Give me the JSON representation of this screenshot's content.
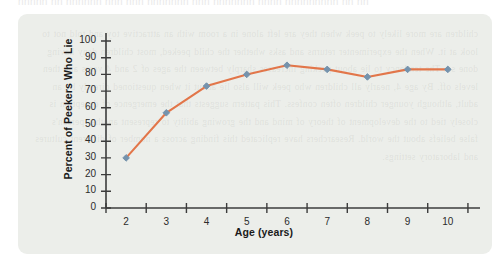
{
  "page": {
    "bleed_text": "nnnnn nn nnnnnn nnn nnn nnnnnnn nnn nnnnnnn nnnn nnnnnnnnn nn nn"
  },
  "figure": {
    "card_background": "#eceeea",
    "ghost_text": "children are more likely to peek when they are left alone in a room with an attractive toy and told not to look at it. When the experimenter returns and asks whether the child peeked, most children deny having done so. The tendency to lie about peeking increases sharply between the ages of 2 and 4 years and then levels off. By age 4, nearly all children who peek will also lie about it when questioned directly by an adult, although younger children often confess. This pattern suggests that the emergence of deception is closely tied to the development of theory of mind and the growing ability to represent another person's false beliefs about the world. Researchers have replicated this finding across a number of different cultures and laboratory settings."
  },
  "chart_data": {
    "type": "line",
    "title": "",
    "xlabel": "Age (years)",
    "ylabel": "Percent of Peekers Who Lie",
    "categories": [
      2,
      3,
      4,
      5,
      6,
      7,
      8,
      9,
      10
    ],
    "x_tick_labels": [
      "2",
      "3",
      "4",
      "5",
      "6",
      "7",
      "8",
      "9",
      "10"
    ],
    "y_tick_labels": [
      "0",
      "10",
      "20",
      "30",
      "40",
      "50",
      "60",
      "70",
      "80",
      "90",
      "100"
    ],
    "y_ticks": [
      0,
      10,
      20,
      30,
      40,
      50,
      60,
      70,
      80,
      90,
      100
    ],
    "values": [
      30,
      57,
      73,
      80,
      85.5,
      83,
      78.5,
      83,
      83
    ],
    "xlim": [
      1.5,
      10.8
    ],
    "ylim": [
      0,
      100
    ],
    "grid": false,
    "legend": "none",
    "line_color": "#e2764a",
    "marker_color": "#7593ad",
    "marker_shape": "diamond",
    "axis_color": "#3c3c3c"
  }
}
